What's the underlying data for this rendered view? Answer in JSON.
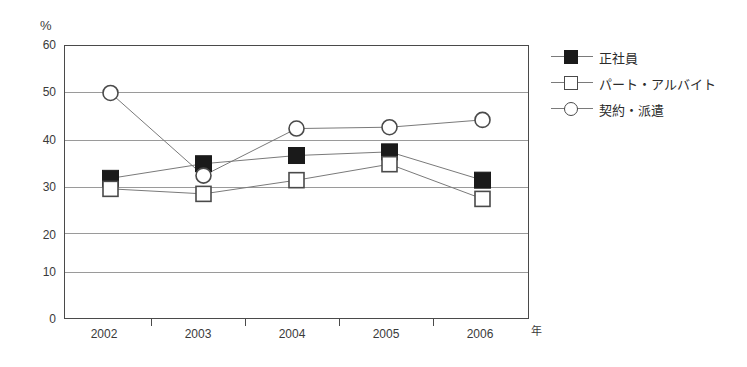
{
  "chart_data": {
    "type": "line",
    "title": "",
    "xlabel": "年",
    "ylabel": "%",
    "categories": [
      "2002",
      "2003",
      "2004",
      "2005",
      "2006"
    ],
    "ylim": [
      0,
      60
    ],
    "yticks": [
      0,
      10,
      20,
      30,
      40,
      50,
      60
    ],
    "grid": true,
    "legend_position": "right",
    "series": [
      {
        "name": "正社員",
        "marker": "filled-square",
        "values": [
          30.8,
          34.0,
          35.8,
          36.6,
          30.4
        ]
      },
      {
        "name": "パート・アルバイト",
        "marker": "open-square",
        "values": [
          28.5,
          27.4,
          30.4,
          33.9,
          26.3
        ]
      },
      {
        "name": "契約・派遣",
        "marker": "open-circle",
        "values": [
          49.5,
          31.4,
          41.7,
          42.0,
          43.6
        ]
      }
    ]
  },
  "axes": {
    "y_unit": "%",
    "x_unit": "年",
    "y_tick_labels": [
      "60",
      "50",
      "40",
      "30",
      "20",
      "10",
      "0"
    ],
    "x_tick_labels": [
      "2002",
      "2003",
      "2004",
      "2005",
      "2006"
    ]
  },
  "legend": {
    "items": [
      {
        "label": "正社員",
        "marker": "filled-square"
      },
      {
        "label": "パート・アルバイト",
        "marker": "open-square"
      },
      {
        "label": "契約・派遣",
        "marker": "open-circle"
      }
    ]
  },
  "colors": {
    "series_filled": "#1a1a1a",
    "series_outline": "#4a4a4a",
    "gridline": "#9a9a9a",
    "frame": "#4a4a4a",
    "line": "#7a7a7a",
    "background": "#ffffff"
  }
}
